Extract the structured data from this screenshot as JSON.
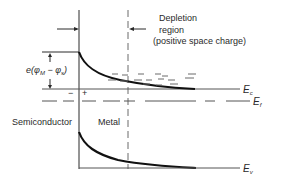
{
  "diagram": {
    "type": "band-diagram",
    "labels": {
      "depletion_line1": "Depletion",
      "depletion_line2": "region",
      "depletion_line3": "(positive space charge)",
      "barrier_prefix": "e(",
      "barrier_phi_m": "φ",
      "barrier_sub_m": "M",
      "barrier_minus": " − ",
      "barrier_phi_s": "φ",
      "barrier_sub_s": "s",
      "barrier_suffix": ")",
      "semiconductor": "Semiconductor",
      "metal": "Metal",
      "ec_main": "E",
      "ec_sub": "c",
      "ef_main": "E",
      "ef_sub": "f",
      "ev_main": "E",
      "ev_sub": "v",
      "minus_sign": "−",
      "plus_sign": "+"
    },
    "colors": {
      "line": "#2a2a2a",
      "curve": "#111111",
      "dash": "#6a6a6a",
      "background": "#ffffff"
    }
  }
}
